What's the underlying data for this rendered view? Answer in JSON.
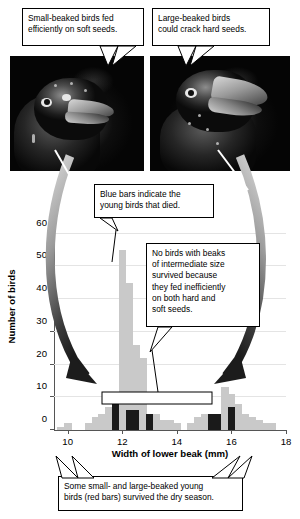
{
  "figure": {
    "callouts": [
      {
        "name": "small-beak-callout",
        "lines": [
          "Small-beaked birds fed",
          "efficiently on soft seeds."
        ]
      },
      {
        "name": "large-beak-callout",
        "lines": [
          "Large-beaked birds",
          "could crack hard seeds."
        ]
      },
      {
        "name": "blue-bars-callout",
        "lines": [
          "Blue bars indicate the",
          "young birds that died."
        ]
      },
      {
        "name": "intermediate-callout",
        "lines": [
          "No birds with beaks",
          "of intermediate size",
          "survived because",
          "they fed inefficiently",
          "on both hard and",
          "soft seeds."
        ]
      },
      {
        "name": "red-bars-callout",
        "lines": [
          "Some small- and large-beaked young",
          "birds (red bars) survived the dry season."
        ]
      }
    ],
    "photos": [
      {
        "name": "small-beaked-finch-photo",
        "alt": "small-beaked finch head"
      },
      {
        "name": "large-beaked-finch-photo",
        "alt": "large-beaked finch head"
      }
    ]
  },
  "chart_data": {
    "type": "bar",
    "title": "",
    "xlabel": "Width of lower beak (mm)",
    "ylabel": "Number of birds",
    "xlim": [
      9.5,
      18.0
    ],
    "ylim": [
      0,
      62
    ],
    "xticks": [
      10,
      12,
      14,
      16,
      18
    ],
    "yticks": [
      0,
      10,
      20,
      30,
      40,
      50,
      60
    ],
    "grid": true,
    "bin_width": 0.25,
    "legend": [
      "Blue bars = young birds that died",
      "Red bars = young birds that survived"
    ],
    "colors": {
      "died": "#c9c9c9",
      "survived": "#1a1a1a"
    },
    "bins": [
      {
        "x": 9.75,
        "died": 1,
        "survived": 0
      },
      {
        "x": 10.0,
        "died": 2,
        "survived": 0
      },
      {
        "x": 10.25,
        "died": 0,
        "survived": 0
      },
      {
        "x": 10.5,
        "died": 0,
        "survived": 0
      },
      {
        "x": 10.75,
        "died": 2,
        "survived": 0
      },
      {
        "x": 11.0,
        "died": 4,
        "survived": 0
      },
      {
        "x": 11.25,
        "died": 5,
        "survived": 0
      },
      {
        "x": 11.5,
        "died": 7,
        "survived": 0
      },
      {
        "x": 11.75,
        "died": 0,
        "survived": 8
      },
      {
        "x": 12.0,
        "died": 55,
        "survived": 0
      },
      {
        "x": 12.25,
        "died": 45,
        "survived": 6
      },
      {
        "x": 12.5,
        "died": 26,
        "survived": 6
      },
      {
        "x": 12.75,
        "died": 22,
        "survived": 0
      },
      {
        "x": 13.0,
        "died": 5,
        "survived": 5
      },
      {
        "x": 13.25,
        "died": 5,
        "survived": 0
      },
      {
        "x": 13.5,
        "died": 3,
        "survived": 0
      },
      {
        "x": 13.75,
        "died": 3,
        "survived": 0
      },
      {
        "x": 14.0,
        "died": 2,
        "survived": 0
      },
      {
        "x": 14.25,
        "died": 0,
        "survived": 0
      },
      {
        "x": 14.5,
        "died": 2,
        "survived": 0
      },
      {
        "x": 14.75,
        "died": 4,
        "survived": 0
      },
      {
        "x": 15.0,
        "died": 5,
        "survived": 0
      },
      {
        "x": 15.25,
        "died": 0,
        "survived": 5
      },
      {
        "x": 15.5,
        "died": 0,
        "survived": 5
      },
      {
        "x": 15.75,
        "died": 13,
        "survived": 0
      },
      {
        "x": 16.0,
        "died": 11,
        "survived": 7
      },
      {
        "x": 16.25,
        "died": 8,
        "survived": 0
      },
      {
        "x": 16.5,
        "died": 5,
        "survived": 0
      },
      {
        "x": 16.75,
        "died": 4,
        "survived": 0
      },
      {
        "x": 17.0,
        "died": 3,
        "survived": 0
      },
      {
        "x": 17.25,
        "died": 2,
        "survived": 0
      },
      {
        "x": 17.5,
        "died": 2,
        "survived": 0
      }
    ]
  }
}
